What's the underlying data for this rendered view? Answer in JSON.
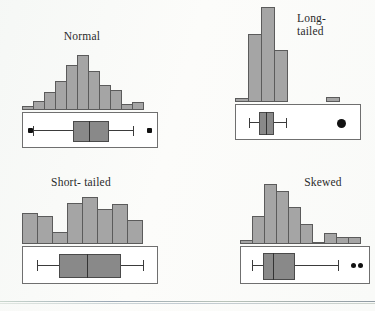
{
  "figure": {
    "background_color": "#fcfcfa",
    "bar_fill": "#a5a5a5",
    "bar_stroke": "#5b5b5b",
    "box_fill": "#898989",
    "box_stroke": "#4a4a4a",
    "outlier_color": "#111111"
  },
  "panels": [
    {
      "id": "normal",
      "label": "Normal",
      "label_lines": "Normal",
      "histogram": {
        "type": "bar",
        "title": "Normal",
        "categories": [
          "1",
          "2",
          "3",
          "4",
          "5",
          "6",
          "7",
          "8",
          "9",
          "10",
          "11"
        ],
        "values": [
          4,
          9,
          19,
          31,
          48,
          58,
          41,
          26,
          21,
          6,
          8
        ],
        "xlabel": "",
        "ylabel": "Frequency",
        "ylim": [
          0,
          60
        ],
        "grid": false
      },
      "boxplot": {
        "type": "boxplot",
        "whisker_min": 4,
        "q1": 39,
        "median": 51,
        "q3": 64,
        "whisker_max": 96,
        "outliers_low": [
          2
        ],
        "outliers_high": [
          98
        ],
        "outlier_shape": "square"
      }
    },
    {
      "id": "long-tailed",
      "label": "Long-tailed",
      "label_lines": "Long-\ntailed",
      "histogram": {
        "type": "bar",
        "title": "Long-tailed",
        "categories": [
          "1",
          "2",
          "3",
          "4",
          "5",
          "6",
          "7",
          "8"
        ],
        "values": [
          3,
          56,
          79,
          43,
          0,
          0,
          0,
          4
        ],
        "xlabel": "",
        "ylabel": "Frequency",
        "ylim": [
          0,
          80
        ],
        "grid": false
      },
      "boxplot": {
        "type": "boxplot",
        "whisker_min": 9,
        "q1": 18,
        "median": 23,
        "q3": 28,
        "whisker_max": 36,
        "outliers_low": [],
        "outliers_high": [
          85
        ],
        "outlier_shape": "circle"
      }
    },
    {
      "id": "short-tailed",
      "label": "Short-tailed",
      "label_lines": "Short- tailed",
      "histogram": {
        "type": "bar",
        "title": "Short-tailed",
        "categories": [
          "1",
          "2",
          "3",
          "4",
          "5",
          "6",
          "7",
          "8"
        ],
        "values": [
          30,
          27,
          12,
          40,
          45,
          34,
          38,
          23
        ],
        "xlabel": "",
        "ylabel": "Frequency",
        "ylim": [
          0,
          48
        ],
        "grid": false
      },
      "boxplot": {
        "type": "boxplot",
        "whisker_min": 10,
        "q1": 24,
        "median": 46,
        "q3": 70,
        "whisker_max": 88,
        "outliers_low": [],
        "outliers_high": [],
        "outlier_shape": "none"
      }
    },
    {
      "id": "skewed",
      "label": "Skewed",
      "label_lines": "Skewed",
      "histogram": {
        "type": "bar",
        "title": "Skewed",
        "categories": [
          "1",
          "2",
          "3",
          "4",
          "5",
          "6",
          "7",
          "8",
          "9",
          "10"
        ],
        "values": [
          4,
          28,
          60,
          53,
          37,
          20,
          2,
          11,
          7,
          7
        ],
        "xlabel": "",
        "ylabel": "Frequency",
        "ylim": [
          0,
          60
        ],
        "grid": false
      },
      "boxplot": {
        "type": "boxplot",
        "whisker_min": 6,
        "q1": 20,
        "median": 26,
        "q3": 37,
        "whisker_max": 76,
        "outliers_low": [],
        "outliers_high": [
          89,
          93
        ],
        "outlier_shape": "circle"
      }
    }
  ]
}
